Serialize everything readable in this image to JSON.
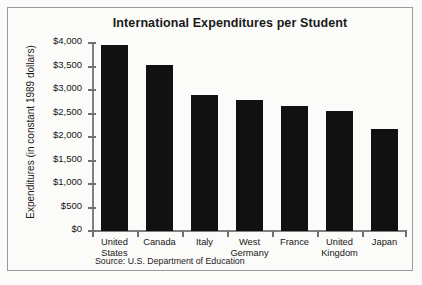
{
  "figure": {
    "border_color": "#9a9a9a",
    "background": "#fbfbf9",
    "bar_color": "#111111",
    "axis_color": "#808080"
  },
  "source_note": "Source: U.S. Department of Education",
  "chart_data": {
    "type": "bar",
    "title": "International Expenditures per Student",
    "xlabel": "",
    "ylabel": "Expenditures\n(in constant 1989\ndollars)",
    "ylabel_lines": [
      "Expenditures",
      "(in constant 1989",
      "dollars)"
    ],
    "categories": [
      "United States",
      "Canada",
      "Italy",
      "West Germany",
      "France",
      "United Kingdom",
      "Japan"
    ],
    "category_labels": [
      "United\nStates",
      "Canada",
      "Italy",
      "West\nGermany",
      "France",
      "United\nKingdom",
      "Japan"
    ],
    "values": [
      3950,
      3530,
      2900,
      2790,
      2670,
      2550,
      2170
    ],
    "ylim": [
      0,
      4000
    ],
    "ytick_values": [
      0,
      500,
      1000,
      1500,
      2000,
      2500,
      3000,
      3500,
      4000
    ],
    "ytick_labels": [
      "$0",
      "$500",
      "$1,000",
      "$1,500",
      "$2,000",
      "$2,500",
      "$3,000",
      "$3,500",
      "$4,000"
    ],
    "grid": false,
    "legend": null,
    "series": [
      {
        "name": "Expenditures per student (constant 1989 dollars)",
        "values": [
          3950,
          3530,
          2900,
          2790,
          2670,
          2550,
          2170
        ]
      }
    ]
  }
}
